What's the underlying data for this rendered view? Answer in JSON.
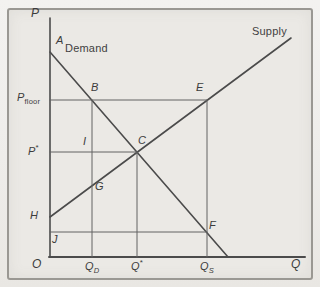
{
  "figure": {
    "background": "#f2f1ee",
    "panel_background": "#ebe9e5",
    "border_color": "#9a9893",
    "line_color": "#4b4b4b",
    "thin_line_color": "#636363",
    "text_color": "#3c3c3c"
  },
  "axes": {
    "p_axis_label": "P",
    "q_axis_label": "Q",
    "origin_label": "O"
  },
  "curves": {
    "demand_label": "Demand",
    "supply_label": "Supply"
  },
  "points": {
    "a": "A",
    "b": "B",
    "c": "C",
    "e": "E",
    "f": "F",
    "g": "G",
    "h": "H",
    "i": "I",
    "j": "J"
  },
  "ticks": {
    "p_floor": {
      "main": "P",
      "sub": "floor"
    },
    "p_star": {
      "main": "P",
      "sup": "*"
    },
    "q_d": {
      "main": "Q",
      "sub": "D"
    },
    "q_star": {
      "main": "Q",
      "sup": "*"
    },
    "q_s": {
      "main": "Q",
      "sub": "S"
    }
  },
  "chart_data": {
    "type": "line",
    "xlabel": "Q",
    "ylabel": "P",
    "series": [
      {
        "name": "Demand",
        "x": [
          0.0,
          7.0
        ],
        "y": [
          8.6,
          0.0
        ]
      },
      {
        "name": "Supply",
        "x": [
          0.0,
          9.5
        ],
        "y": [
          1.7,
          9.2
        ]
      }
    ],
    "reference_levels": {
      "p_floor": 6.6,
      "p_star": 4.4,
      "j_level": 1.0
    },
    "reference_quantities": {
      "q_d": 1.65,
      "q_star": 3.4,
      "q_s": 6.15
    },
    "labeled_points": [
      "A",
      "B",
      "C",
      "E",
      "F",
      "G",
      "H",
      "I",
      "J",
      "O"
    ]
  },
  "geometry": {
    "lines": [
      {
        "name": "p-axis",
        "x1": 50,
        "y1": 18,
        "x2": 50,
        "y2": 257,
        "w": 1.6,
        "c": "main"
      },
      {
        "name": "q-axis",
        "x1": 49,
        "y1": 257,
        "x2": 305,
        "y2": 257,
        "w": 2.0,
        "c": "main"
      },
      {
        "name": "demand-curve",
        "x1": 50,
        "y1": 52,
        "x2": 228,
        "y2": 257,
        "w": 1.6,
        "c": "main"
      },
      {
        "name": "supply-curve",
        "x1": 50,
        "y1": 217,
        "x2": 291,
        "y2": 38,
        "w": 1.6,
        "c": "main"
      },
      {
        "name": "p-floor-line",
        "x1": 50,
        "y1": 100,
        "x2": 207,
        "y2": 100,
        "w": 1.0,
        "c": "thin"
      },
      {
        "name": "p-star-line",
        "x1": 50,
        "y1": 152,
        "x2": 137,
        "y2": 152,
        "w": 1.0,
        "c": "thin"
      },
      {
        "name": "j-level-line",
        "x1": 50,
        "y1": 232,
        "x2": 207,
        "y2": 232,
        "w": 1.0,
        "c": "thin"
      },
      {
        "name": "qd-line",
        "x1": 92,
        "y1": 100,
        "x2": 92,
        "y2": 257,
        "w": 1.0,
        "c": "thin"
      },
      {
        "name": "qstar-line",
        "x1": 137,
        "y1": 152,
        "x2": 137,
        "y2": 257,
        "w": 1.0,
        "c": "thin"
      },
      {
        "name": "qs-line",
        "x1": 207,
        "y1": 100,
        "x2": 207,
        "y2": 257,
        "w": 1.0,
        "c": "thin"
      }
    ]
  }
}
